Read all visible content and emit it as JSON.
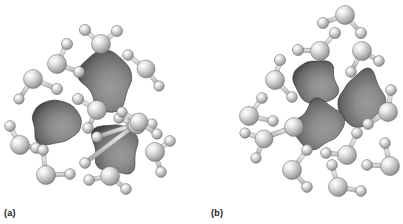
{
  "figure": {
    "caption_a": "(a)",
    "caption_b": "(b)",
    "background_color": "#ffffff",
    "panels": [
      {
        "id": "a",
        "label": "(a)",
        "description": "Nonpolar solute particles dispersed individually among water molecules",
        "solute_count": 3,
        "water_count": 13
      },
      {
        "id": "b",
        "label": "(b)",
        "description": "Nonpolar solute particles aggregated into a single cluster surrounded by water molecules",
        "solute_count": 3,
        "water_count": 14
      }
    ]
  },
  "style": {
    "sphere_light_color": "#e8e8e8",
    "sphere_mid_color": "#b4b4b4",
    "sphere_dark_color": "#868686",
    "sphere_edge_color": "#6e6e6e",
    "blob_light_color": "#8c8c8c",
    "blob_mid_color": "#6a6a6a",
    "blob_dark_color": "#3c3c3c",
    "bond_color": "#b9b9b9",
    "bond_edge_color": "#8d8d8d",
    "label_color": "#1a1a1a"
  },
  "scene": {
    "panel_a": {
      "blobs": [
        {
          "name": "solute-particle-1",
          "cx": 107,
          "cy": 80,
          "rx": 26,
          "ry": 28,
          "rot": -12,
          "seed": 1
        },
        {
          "name": "solute-particle-2",
          "cx": 56,
          "cy": 124,
          "rx": 28,
          "ry": 24,
          "rot": 8,
          "seed": 2
        },
        {
          "name": "solute-particle-3",
          "cx": 116,
          "cy": 148,
          "rx": 25,
          "ry": 26,
          "rot": 16,
          "seed": 3
        }
      ],
      "waters": [
        {
          "name": "water-molecule-1",
          "ox": 101,
          "oy": 44,
          "or": 9.5,
          "h": [
            {
              "x": 85,
              "y": 30,
              "r": 5.6
            },
            {
              "x": 117,
              "y": 31,
              "r": 5.6
            }
          ]
        },
        {
          "name": "water-molecule-2",
          "ox": 57,
          "oy": 64,
          "or": 9.5,
          "h": [
            {
              "x": 67,
              "y": 44,
              "r": 5.6
            },
            {
              "x": 79,
              "y": 72,
              "r": 5.6
            }
          ]
        },
        {
          "name": "water-molecule-3",
          "ox": 33,
          "oy": 79,
          "or": 9.5,
          "h": [
            {
              "x": 57,
              "y": 89,
              "r": 5.6
            },
            {
              "x": 19,
              "y": 99,
              "r": 5.2
            }
          ]
        },
        {
          "name": "water-molecule-4",
          "ox": 146,
          "oy": 69,
          "or": 9.0,
          "h": [
            {
              "x": 128,
              "y": 55,
              "r": 5.4
            },
            {
              "x": 159,
              "y": 86,
              "r": 5.2
            }
          ]
        },
        {
          "name": "water-molecule-5",
          "ox": 97,
          "oy": 110,
          "or": 9.5,
          "h": [
            {
              "x": 78,
              "y": 99,
              "r": 5.6
            },
            {
              "x": 88,
              "y": 128,
              "r": 5.4
            }
          ]
        },
        {
          "name": "water-molecule-6",
          "ox": 136,
          "oy": 124,
          "or": 9.5,
          "h": [
            {
              "x": 97,
              "y": 137,
              "r": 5.4
            },
            {
              "x": 85,
              "y": 163,
              "r": 5.4
            }
          ]
        },
        {
          "name": "water-molecule-7",
          "ox": 136,
          "oy": 124,
          "or": 0.0,
          "h": []
        },
        {
          "name": "water-molecule-8",
          "ox": 20,
          "oy": 145,
          "or": 9.5,
          "h": [
            {
              "x": 10,
              "y": 126,
              "r": 5.4
            },
            {
              "x": 36,
              "y": 148,
              "r": 5.4
            }
          ]
        },
        {
          "name": "water-molecule-9",
          "ox": 46,
          "oy": 175,
          "or": 9.5,
          "h": [
            {
              "x": 43,
              "y": 150,
              "r": 5.4
            },
            {
              "x": 70,
              "y": 174,
              "r": 5.4
            }
          ]
        },
        {
          "name": "water-molecule-10",
          "ox": 137,
          "oy": 125,
          "or": 9.0,
          "h": [
            {
              "x": 119,
              "y": 118,
              "r": 5.2
            },
            {
              "x": 152,
              "y": 124,
              "r": 5.2
            }
          ]
        },
        {
          "name": "water-molecule-11",
          "ox": 110,
          "oy": 176,
          "or": 9.5,
          "h": [
            {
              "x": 89,
              "y": 180,
              "r": 5.4
            },
            {
              "x": 126,
              "y": 189,
              "r": 5.4
            }
          ]
        },
        {
          "name": "water-molecule-12",
          "ox": 155,
          "oy": 152,
          "or": 9.5,
          "h": [
            {
              "x": 170,
              "y": 141,
              "r": 5.4
            },
            {
              "x": 161,
              "y": 172,
              "r": 5.4
            }
          ]
        },
        {
          "name": "water-molecule-13",
          "ox": 139,
          "oy": 122,
          "or": 9.0,
          "h": [
            {
              "x": 122,
              "y": 112,
              "r": 5.2
            },
            {
              "x": 157,
              "y": 134,
              "r": 5.2
            }
          ]
        }
      ]
    },
    "panel_b": {
      "blobs": [
        {
          "name": "solute-particle-1",
          "cx": 115,
          "cy": 80,
          "rx": 25,
          "ry": 24,
          "rot": -8,
          "seed": 4
        },
        {
          "name": "solute-particle-2",
          "cx": 158,
          "cy": 98,
          "rx": 24,
          "ry": 27,
          "rot": 10,
          "seed": 5
        },
        {
          "name": "solute-particle-3",
          "cx": 117,
          "cy": 126,
          "rx": 26,
          "ry": 26,
          "rot": -16,
          "seed": 6
        }
      ],
      "waters": [
        {
          "name": "water-molecule-1",
          "ox": 144,
          "oy": 15,
          "or": 9.5,
          "h": [
            {
              "x": 122,
              "y": 23,
              "r": 5.6
            },
            {
              "x": 160,
              "y": 33,
              "r": 5.6
            }
          ]
        },
        {
          "name": "water-molecule-2",
          "ox": 119,
          "oy": 51,
          "or": 9.5,
          "h": [
            {
              "x": 97,
              "y": 50,
              "r": 5.6
            },
            {
              "x": 134,
              "y": 33,
              "r": 5.6
            }
          ]
        },
        {
          "name": "water-molecule-3",
          "ox": 161,
          "oy": 51,
          "or": 9.5,
          "h": [
            {
              "x": 178,
              "y": 61,
              "r": 5.4
            },
            {
              "x": 150,
              "y": 72,
              "r": 5.4
            }
          ]
        },
        {
          "name": "water-molecule-4",
          "ox": 74,
          "oy": 80,
          "or": 9.5,
          "h": [
            {
              "x": 79,
              "y": 60,
              "r": 5.6
            },
            {
              "x": 91,
              "y": 97,
              "r": 5.4
            }
          ]
        },
        {
          "name": "water-molecule-5",
          "ox": 48,
          "oy": 116,
          "or": 9.5,
          "h": [
            {
              "x": 61,
              "y": 98,
              "r": 5.4
            },
            {
              "x": 72,
              "y": 121,
              "r": 5.4
            }
          ]
        },
        {
          "name": "water-molecule-6",
          "ox": 93,
          "oy": 127,
          "or": 9.5,
          "h": [
            {
              "x": 65,
              "y": 137,
              "r": 5.4
            },
            {
              "x": 63,
              "y": 138,
              "r": 5.2
            }
          ]
        },
        {
          "name": "water-molecule-7",
          "ox": 146,
          "oy": 155,
          "or": 9.5,
          "h": [
            {
              "x": 125,
              "y": 153,
              "r": 5.4
            },
            {
              "x": 156,
              "y": 133,
              "r": 5.4
            }
          ]
        },
        {
          "name": "water-molecule-8",
          "ox": 91,
          "oy": 170,
          "or": 9.5,
          "h": [
            {
              "x": 106,
              "y": 150,
              "r": 5.4
            },
            {
              "x": 106,
              "y": 187,
              "r": 5.4
            }
          ]
        },
        {
          "name": "water-molecule-9",
          "ox": 137,
          "oy": 187,
          "or": 9.5,
          "h": [
            {
              "x": 131,
              "y": 165,
              "r": 5.4
            },
            {
              "x": 160,
              "y": 191,
              "r": 5.4
            }
          ]
        },
        {
          "name": "water-molecule-10",
          "ox": 187,
          "oy": 112,
          "or": 9.5,
          "h": [
            {
              "x": 190,
              "y": 90,
              "r": 5.4
            },
            {
              "x": 167,
              "y": 124,
              "r": 5.4
            }
          ]
        },
        {
          "name": "water-molecule-11",
          "ox": 189,
          "oy": 166,
          "or": 9.5,
          "h": [
            {
              "x": 166,
              "y": 165,
              "r": 5.4
            },
            {
              "x": 184,
              "y": 143,
              "r": 5.4
            }
          ]
        },
        {
          "name": "water-molecule-12",
          "ox": 63,
          "oy": 139,
          "or": 9.0,
          "h": [
            {
              "x": 44,
              "y": 133,
              "r": 5.2
            },
            {
              "x": 55,
              "y": 158,
              "r": 5.2
            }
          ]
        },
        {
          "name": "water-molecule-13",
          "ox": 119,
          "oy": 50,
          "or": 0.0,
          "h": []
        },
        {
          "name": "water-molecule-14",
          "ox": 175,
          "oy": 61,
          "or": 0.0,
          "h": []
        }
      ]
    }
  }
}
